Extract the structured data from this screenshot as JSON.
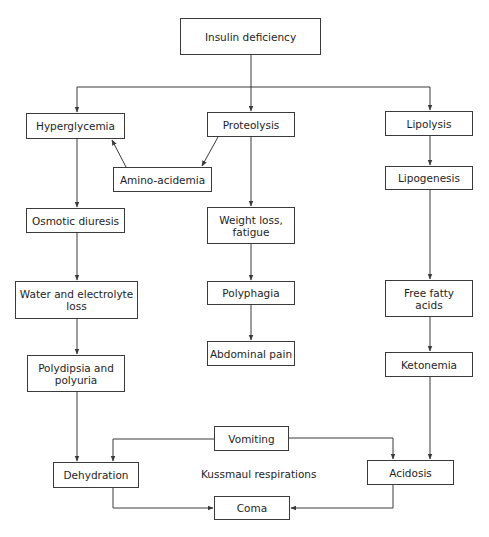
{
  "diagram": {
    "nodes": {
      "insulin_deficiency": "Insulin deficiency",
      "hyperglycemia": "Hyperglycemia",
      "proteolysis": "Proteolysis",
      "lipolysis": "Lipolysis",
      "amino_acidemia": "Amino-acidemia",
      "lipogenesis": "Lipogenesis",
      "osmotic_diuresis": "Osmotic diuresis",
      "weight_loss": "Weight loss,\nfatigue",
      "water_electrolyte_loss": "Water and electrolyte\nloss",
      "polyphagia": "Polyphagia",
      "free_fatty_acids": "Free fatty\nacids",
      "abdominal_pain": "Abdominal pain",
      "polydipsia_polyuria": "Polydipsia and\npolyuria",
      "ketonemia": "Ketonemia",
      "vomiting": "Vomiting",
      "dehydration": "Dehydration",
      "acidosis": "Acidosis",
      "coma": "Coma"
    },
    "annotations": {
      "kussmaul": "Kussmaul respirations"
    },
    "edges": [
      [
        "insulin_deficiency",
        "hyperglycemia"
      ],
      [
        "insulin_deficiency",
        "proteolysis"
      ],
      [
        "insulin_deficiency",
        "lipolysis"
      ],
      [
        "proteolysis",
        "amino_acidemia"
      ],
      [
        "amino_acidemia",
        "hyperglycemia"
      ],
      [
        "hyperglycemia",
        "osmotic_diuresis"
      ],
      [
        "osmotic_diuresis",
        "water_electrolyte_loss"
      ],
      [
        "water_electrolyte_loss",
        "polydipsia_polyuria"
      ],
      [
        "polydipsia_polyuria",
        "dehydration"
      ],
      [
        "proteolysis",
        "weight_loss"
      ],
      [
        "weight_loss",
        "polyphagia"
      ],
      [
        "polyphagia",
        "abdominal_pain"
      ],
      [
        "lipolysis",
        "lipogenesis"
      ],
      [
        "lipogenesis",
        "free_fatty_acids"
      ],
      [
        "free_fatty_acids",
        "ketonemia"
      ],
      [
        "ketonemia",
        "acidosis"
      ],
      [
        "vomiting",
        "dehydration"
      ],
      [
        "vomiting",
        "acidosis"
      ],
      [
        "dehydration",
        "coma"
      ],
      [
        "acidosis",
        "coma"
      ]
    ],
    "colors": {
      "line": "#3a3a3a",
      "text": "#1e1e1e",
      "background": "#ffffff"
    }
  }
}
